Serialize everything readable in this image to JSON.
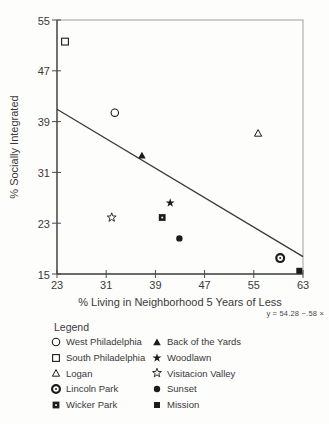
{
  "chart_data": {
    "type": "scatter",
    "title": "",
    "xlabel": "% Living in Neighborhood 5 Years of Less",
    "ylabel": "% Socially Integrated",
    "xlim": [
      23,
      63
    ],
    "ylim": [
      15,
      55
    ],
    "x_ticks": [
      "23",
      "31",
      "39",
      "47",
      "55",
      "63"
    ],
    "x_tick_values": [
      23,
      31,
      39,
      47,
      55,
      63
    ],
    "y_ticks": [
      "15",
      "23",
      "31",
      "39",
      "47",
      "55"
    ],
    "y_tick_values": [
      15,
      23,
      31,
      39,
      47,
      55
    ],
    "grid": false,
    "equation_label": "y = 54.28 −.58 ×",
    "regression": {
      "intercept": 54.28,
      "slope": -0.58
    },
    "points": [
      {
        "name": "West Philadelphia",
        "symbol": "circle-open",
        "x": 32.4,
        "y": 40.4
      },
      {
        "name": "South Philadelphia",
        "symbol": "square-open",
        "x": 24.3,
        "y": 51.6
      },
      {
        "name": "Logan",
        "symbol": "triangle-open",
        "x": 55.7,
        "y": 37.2
      },
      {
        "name": "Lincoln Park",
        "symbol": "circle-bullseye",
        "x": 59.3,
        "y": 17.5
      },
      {
        "name": "Wicker Park",
        "symbol": "square-dot",
        "x": 40.1,
        "y": 23.9
      },
      {
        "name": "Back of the Yards",
        "symbol": "triangle-filled",
        "x": 36.8,
        "y": 33.7
      },
      {
        "name": "Woodlawn",
        "symbol": "star-filled",
        "x": 41.4,
        "y": 26.2
      },
      {
        "name": "Visitacion Valley",
        "symbol": "star-open",
        "x": 31.9,
        "y": 23.9
      },
      {
        "name": "Sunset",
        "symbol": "circle-filled",
        "x": 42.9,
        "y": 20.6
      },
      {
        "name": "Mission",
        "symbol": "square-filled",
        "x": 62.4,
        "y": 15.5
      }
    ],
    "legend_position": "bottom"
  },
  "legend": {
    "title": "Legend",
    "columns": [
      [
        "West Philadelphia",
        "South Philadelphia",
        "Logan",
        "Lincoln Park",
        "Wicker Park"
      ],
      [
        "Back of the Yards",
        "Woodlawn",
        "Visitacion Valley",
        "Sunset",
        "Mission"
      ]
    ]
  },
  "style": {
    "ink": "#1c1c1c",
    "axis_color": "#4a4a4a",
    "frame_color": "#9e9e9e",
    "line_color": "#3a3a3a"
  }
}
